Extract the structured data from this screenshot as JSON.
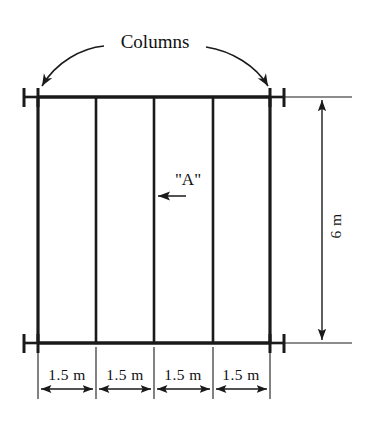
{
  "diagram": {
    "annotations": {
      "columns_label": "Columns",
      "member_label": "\"A\""
    },
    "dimensions": {
      "height_label": "6 m",
      "bay_labels": [
        "1.5 m",
        "1.5 m",
        "1.5 m",
        "1.5 m"
      ],
      "bay_count": 4,
      "bay_width_value": 1.5,
      "bay_width_unit": "m",
      "total_width_value": 6.0,
      "height_value": 6,
      "height_unit": "m"
    },
    "colors": {
      "line": "#1a1a1a",
      "background": "#ffffff",
      "text": "#111111"
    },
    "geometry": {
      "column_x": [
        38,
        96,
        154,
        213,
        270
      ],
      "beam_top_y": 97,
      "beam_bottom_y": 343,
      "dimension_line_x": 322,
      "bottom_dimension_y": 389,
      "support_flange_offset": 14
    },
    "structure": {
      "column_count": 5,
      "beam_count": 2,
      "support_type": "fixed-flange"
    }
  }
}
